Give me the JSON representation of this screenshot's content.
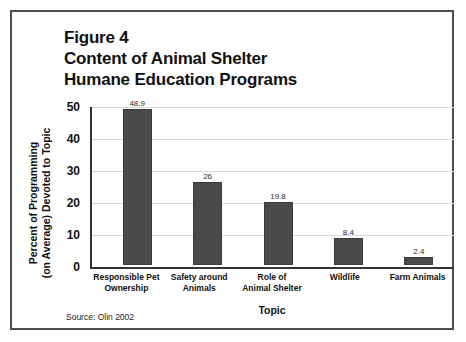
{
  "figure": {
    "title_lines": [
      "Figure 4",
      "Content of Animal Shelter",
      "Humane Education Programs"
    ],
    "source_note": "Source: Olin 2002",
    "border_color": "#4d4d55"
  },
  "chart_data": {
    "type": "bar",
    "title": "Figure 4 Content of Animal Shelter Humane Education Programs",
    "categories": [
      "Responsible Pet Ownership",
      "Safety around Animals",
      "Role of Animal Shelter",
      "Wildlife",
      "Farm Animals"
    ],
    "category_lines": [
      [
        "Responsible Pet",
        "Ownership"
      ],
      [
        "Safety around",
        "Animals"
      ],
      [
        "Role of",
        "Animal Shelter"
      ],
      [
        "Wildlife",
        ""
      ],
      [
        "Farm Animals",
        ""
      ]
    ],
    "values": [
      48.9,
      26,
      19.8,
      8.4,
      2.4
    ],
    "value_labels": [
      "48.9",
      "26",
      "19.8",
      "8.4",
      "2.4"
    ],
    "xlabel": "Topic",
    "ylabel_lines": [
      "Percent of Programming",
      "(on Average) Devoted to Topic"
    ],
    "ylabel": "Percent of Programming (on Average) Devoted to Topic",
    "ylim": [
      0,
      50
    ],
    "yticks": [
      0,
      10,
      20,
      30,
      40,
      50
    ],
    "ytick_labels": [
      "0",
      "10",
      "20",
      "30",
      "40",
      "50"
    ],
    "grid": true,
    "legend": false,
    "bar_color": "#4a4a4a",
    "gridline_color": "#d6d6d6",
    "axis_color": "#333333"
  }
}
